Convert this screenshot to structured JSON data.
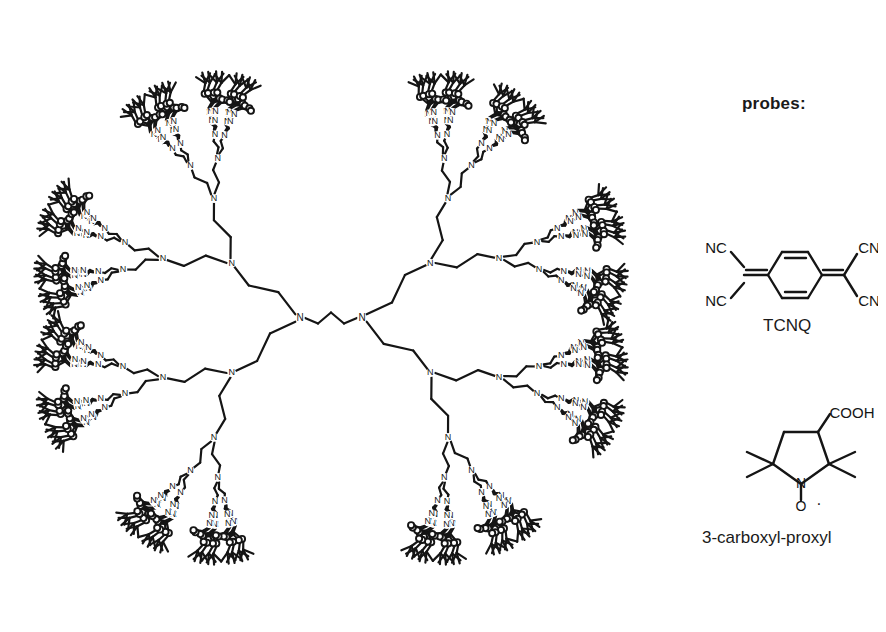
{
  "figure": {
    "background": "#ffffff",
    "ink": "#151515",
    "width": 886,
    "height": 632
  },
  "dendrimer": {
    "name": "poly(propylene imine) dendrimer",
    "center": {
      "x": 330,
      "y": 318
    },
    "radius_x": 322,
    "radius_y": 312,
    "core_label": "N",
    "core_left": {
      "x": 300,
      "y": 318
    },
    "core_right": {
      "x": 362,
      "y": 318
    },
    "generations": 5,
    "terminal_count": 64,
    "branch_node_label": "N",
    "amide_nitrogen_label": "N",
    "carbonyl_oxygen_label": "O",
    "ester_oxygen_label": "O",
    "bond_width": 2.2,
    "label_font_size": 9
  },
  "probes": {
    "heading": "probes:",
    "heading_pos": {
      "x": 742,
      "y": 94
    },
    "items": [
      {
        "id": "tcnq",
        "caption": "TCNQ",
        "caption_pos": {
          "x": 763,
          "y": 316
        },
        "structure_pos": {
          "x": 698,
          "y": 232
        },
        "labels": {
          "nc_top_left": "NC",
          "nc_bottom_left": "NC",
          "cn_top_right": "CN",
          "cn_bottom_right": "CN"
        }
      },
      {
        "id": "carboxyl-proxyl",
        "caption": "3-carboxyl-proxyl",
        "caption_pos": {
          "x": 702,
          "y": 528
        },
        "structure_pos": {
          "x": 735,
          "y": 408
        },
        "labels": {
          "carboxyl": "COOH",
          "ring_nitrogen": "N",
          "nitroxide_oxygen": "O",
          "radical_dot": "·"
        }
      }
    ]
  }
}
